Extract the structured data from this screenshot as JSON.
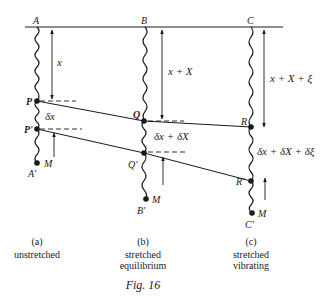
{
  "figure": {
    "title": "Fig. 16",
    "colors": {
      "ink": "#1a1a1a",
      "background": "#ffffff"
    }
  },
  "columns": [
    {
      "id": "a",
      "top_label": "A",
      "p_label": "P",
      "p2_label": "P'",
      "mass_label": "M",
      "bottom_label": "A'",
      "length_label": "x",
      "segment_label": "δx",
      "caption_letter": "(a)",
      "caption_line1": "unstretched",
      "caption_line2": ""
    },
    {
      "id": "b",
      "top_label": "B",
      "p_label": "Q",
      "p2_label": "Q'",
      "mass_label": "M",
      "bottom_label": "B'",
      "length_label": "x + X",
      "segment_label": "δx + δX",
      "caption_letter": "(b)",
      "caption_line1": "stretched",
      "caption_line2": "equilibrium"
    },
    {
      "id": "c",
      "top_label": "C",
      "p_label": "R",
      "p2_label": "R'",
      "mass_label": "M",
      "bottom_label": "C'",
      "length_label": "x + X + ξ",
      "segment_label": "δx + δX + δξ",
      "caption_letter": "(c)",
      "caption_line1": "stretched",
      "caption_line2": "vibrating"
    }
  ]
}
